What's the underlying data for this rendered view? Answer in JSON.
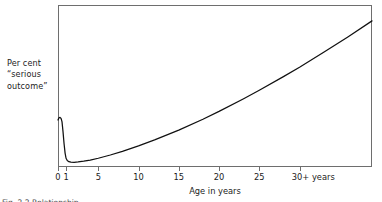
{
  "figure": {
    "name": "serious-outcome-vs-age-curve",
    "caption_partial": "Fig. 2.2  Relationship"
  },
  "chart_data": {
    "type": "line",
    "title": "",
    "subtitle": "",
    "xlabel": "Age in years",
    "ylabel": "Per cent “serious outcome”",
    "ylabel_lines": [
      "Per cent",
      "“serious",
      "outcome”"
    ],
    "grid": false,
    "legend": "none",
    "xtick_labels": [
      "0",
      "1",
      "5",
      "10",
      "15",
      "20",
      "25",
      "30+ years"
    ],
    "xtick_values": [
      0,
      1,
      5,
      10,
      15,
      20,
      25,
      30
    ],
    "xlim": [
      0,
      39
    ],
    "ylim": [
      0,
      100
    ],
    "yticks": [],
    "ytick_labels": [],
    "axis_style": "box-frame",
    "series": [
      {
        "name": "Per cent serious outcome",
        "color": "#111111",
        "x": [
          0,
          0.12,
          0.25,
          0.38,
          0.5,
          0.62,
          0.75,
          0.88,
          1.0,
          1.15,
          1.35,
          1.6,
          2.0,
          2.5,
          3.2,
          4.0,
          5.0,
          6.5,
          8.0,
          10.0,
          12.0,
          15.0,
          18.0,
          20.0,
          23.0,
          25.0,
          28.0,
          30.0,
          33.0,
          36.0,
          39.0
        ],
        "y": [
          29.0,
          30.4,
          30.6,
          30.0,
          27.8,
          22.0,
          14.5,
          8.6,
          5.4,
          4.0,
          3.3,
          3.0,
          2.9,
          3.1,
          3.6,
          4.3,
          5.4,
          7.4,
          9.6,
          13.0,
          16.7,
          22.8,
          29.5,
          34.3,
          42.0,
          47.4,
          55.8,
          61.6,
          70.8,
          80.3,
          90.2
        ]
      }
    ],
    "annotations": []
  }
}
